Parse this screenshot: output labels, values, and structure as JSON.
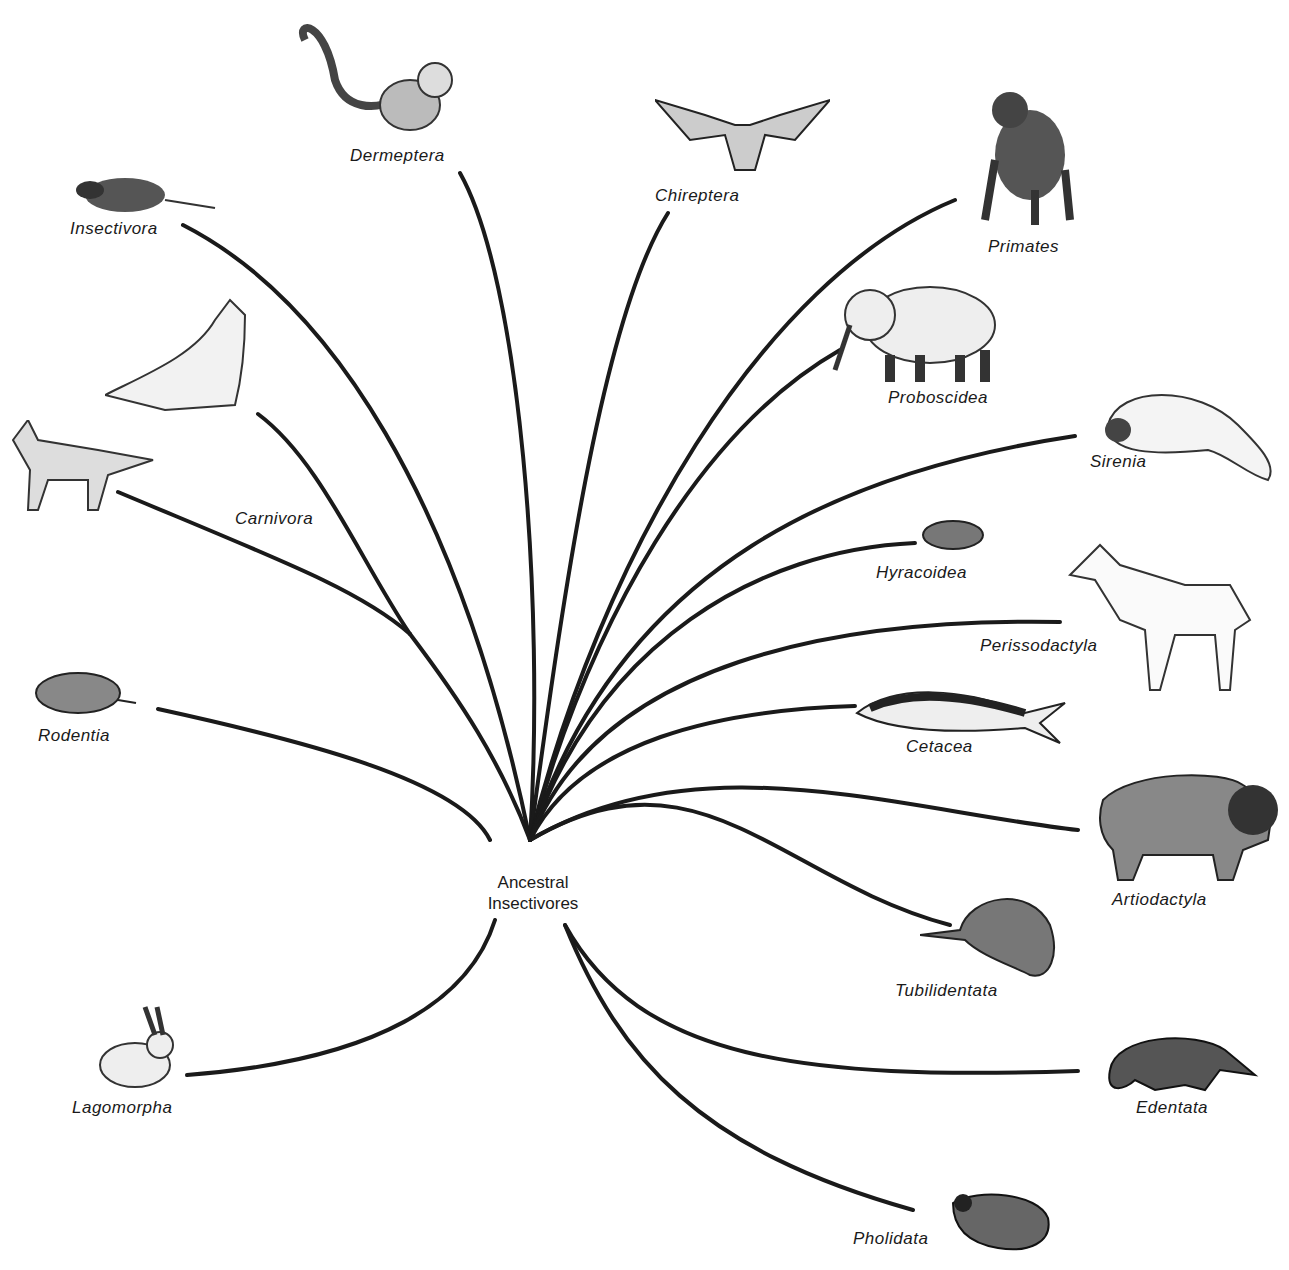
{
  "diagram": {
    "type": "phylogenetic-radiation",
    "root": {
      "line1": "Ancestral",
      "line2": "Insectivores"
    },
    "orders": [
      {
        "id": "insectivora",
        "label": "Insectivora",
        "icon": "shrew-icon"
      },
      {
        "id": "dermeptera",
        "label": "Dermeptera",
        "icon": "colugo-icon"
      },
      {
        "id": "chireptera",
        "label": "Chireptera",
        "icon": "bat-icon"
      },
      {
        "id": "primates",
        "label": "Primates",
        "icon": "ape-icon"
      },
      {
        "id": "proboscidea",
        "label": "Proboscidea",
        "icon": "elephant-icon"
      },
      {
        "id": "sirenia",
        "label": "Sirenia",
        "icon": "manatee-icon"
      },
      {
        "id": "hyracoidea",
        "label": "Hyracoidea",
        "icon": "hyrax-icon"
      },
      {
        "id": "perissodactyla",
        "label": "Perissodactyla",
        "icon": "horse-icon"
      },
      {
        "id": "cetacea",
        "label": "Cetacea",
        "icon": "dolphin-icon"
      },
      {
        "id": "artiodactyla",
        "label": "Artiodactyla",
        "icon": "bison-icon"
      },
      {
        "id": "tubilidentata",
        "label": "Tubilidentata",
        "icon": "aardvark-icon"
      },
      {
        "id": "edentata",
        "label": "Edentata",
        "icon": "anteater-icon"
      },
      {
        "id": "pholidata",
        "label": "Pholidata",
        "icon": "pangolin-icon"
      },
      {
        "id": "lagomorpha",
        "label": "Lagomorpha",
        "icon": "rabbit-icon"
      },
      {
        "id": "rodentia",
        "label": "Rodentia",
        "icon": "rodent-icon"
      },
      {
        "id": "carnivora",
        "label": "Carnivora",
        "icon": "seal-fox-icon"
      }
    ],
    "colors": {
      "line": "#1a1a1a",
      "background": "#ffffff"
    }
  }
}
